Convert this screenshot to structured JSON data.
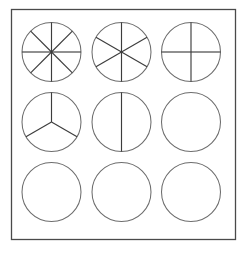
{
  "figure": {
    "frame": {
      "x": 11.5,
      "y": 9.5,
      "width": 224,
      "height": 230,
      "stroke_color": "#4a4a4a"
    },
    "circle_stroke_color": "#6d6d6d",
    "divider_stroke_color": "#3d3d3d",
    "background_color": "#ffffff",
    "radius": 29.5,
    "columns_cx": [
      51.5,
      121.5,
      191.0
    ],
    "rows_cy": [
      52.0,
      122.0,
      192.0
    ],
    "rows": 3,
    "columns": 3
  },
  "chart_data": {
    "type": "pie",
    "xlabel": "",
    "ylabel": "",
    "grid": false,
    "legend": "none",
    "layout": {
      "rows": 3,
      "columns": 3
    },
    "circles": [
      {
        "index": 0,
        "row": 0,
        "column": 0,
        "label": "eighths",
        "denominator": 8,
        "fraction": "1/8",
        "slices": 8,
        "cx": 51.5,
        "cy": 52.0,
        "r": 29.5,
        "divider_angles_deg": [
          0,
          45,
          90,
          135,
          180,
          225,
          270,
          315
        ],
        "values": [
          12.5,
          12.5,
          12.5,
          12.5,
          12.5,
          12.5,
          12.5,
          12.5
        ]
      },
      {
        "index": 1,
        "row": 0,
        "column": 1,
        "label": "sixths",
        "denominator": 6,
        "fraction": "1/6",
        "slices": 6,
        "cx": 121.5,
        "cy": 52.0,
        "r": 29.5,
        "divider_angles_deg": [
          30,
          90,
          150,
          210,
          270,
          330
        ],
        "values": [
          16.67,
          16.67,
          16.67,
          16.67,
          16.67,
          16.67
        ]
      },
      {
        "index": 2,
        "row": 0,
        "column": 2,
        "label": "quarters",
        "denominator": 4,
        "fraction": "1/4",
        "slices": 4,
        "cx": 191.0,
        "cy": 52.0,
        "r": 29.5,
        "divider_angles_deg": [
          0,
          90,
          180,
          270
        ],
        "values": [
          25,
          25,
          25,
          25
        ]
      },
      {
        "index": 3,
        "row": 1,
        "column": 0,
        "label": "thirds",
        "denominator": 3,
        "fraction": "1/3",
        "slices": 3,
        "cx": 51.5,
        "cy": 122.0,
        "r": 29.5,
        "divider_angles_deg": [
          90,
          210,
          330
        ],
        "values": [
          33.33,
          33.33,
          33.33
        ]
      },
      {
        "index": 4,
        "row": 1,
        "column": 1,
        "label": "halves",
        "denominator": 2,
        "fraction": "1/2",
        "slices": 2,
        "cx": 121.5,
        "cy": 122.0,
        "r": 29.5,
        "divider_angles_deg": [
          90,
          270
        ],
        "values": [
          50,
          50
        ]
      },
      {
        "index": 5,
        "row": 1,
        "column": 2,
        "label": "whole",
        "denominator": 1,
        "fraction": "1/1",
        "slices": 1,
        "cx": 191.0,
        "cy": 122.0,
        "r": 29.5,
        "divider_angles_deg": [],
        "values": [
          100
        ]
      },
      {
        "index": 6,
        "row": 2,
        "column": 0,
        "label": "whole",
        "denominator": 1,
        "fraction": "1/1",
        "slices": 1,
        "cx": 51.5,
        "cy": 192.0,
        "r": 29.5,
        "divider_angles_deg": [],
        "values": [
          100
        ]
      },
      {
        "index": 7,
        "row": 2,
        "column": 1,
        "label": "whole",
        "denominator": 1,
        "fraction": "1/1",
        "slices": 1,
        "cx": 121.5,
        "cy": 192.0,
        "r": 29.5,
        "divider_angles_deg": [],
        "values": [
          100
        ]
      },
      {
        "index": 8,
        "row": 2,
        "column": 2,
        "label": "whole",
        "denominator": 1,
        "fraction": "1/1",
        "slices": 1,
        "cx": 191.0,
        "cy": 192.0,
        "r": 29.5,
        "divider_angles_deg": [],
        "values": [
          100
        ]
      }
    ]
  }
}
